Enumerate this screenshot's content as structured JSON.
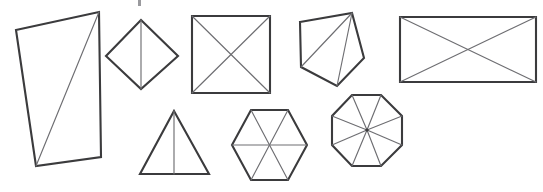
{
  "figure": {
    "background_color": "#ffffff",
    "outline_color": "#3b3b3d",
    "diagonal_color": "#6e6e72",
    "canvas": {
      "width": 543,
      "height": 192
    },
    "shape_count": 8,
    "artifact": {
      "name": "clipped-text-remnant",
      "x": 138,
      "y": 0,
      "width": 3,
      "height": 6
    },
    "shapes": [
      {
        "id": "tilted-rectangle",
        "label": "Tilted rectangle with one diagonal",
        "sides": 4,
        "triangles": 2,
        "outline": "16,30 99,12 101,157 36,166",
        "diagonals": [
          "99,12 36,166"
        ]
      },
      {
        "id": "diamond",
        "label": "Diamond with vertical diagonal",
        "sides": 4,
        "triangles": 2,
        "outline": "141,20 178,56 141,89 106,56",
        "diagonals": [
          "141,20 141,89"
        ]
      },
      {
        "id": "square",
        "label": "Square with both diagonals",
        "sides": 4,
        "triangles": 4,
        "outline": "192,16 270,16 270,93 192,93",
        "diagonals": [
          "192,16 270,93",
          "270,16 192,93"
        ]
      },
      {
        "id": "pentagon",
        "label": "Tilted pentagon fanned from top-right vertex",
        "sides": 5,
        "triangles": 3,
        "outline": "300,22 352,13 364,58 337,86 301,67",
        "diagonals": [
          "352,13 301,67",
          "352,13 337,86"
        ]
      },
      {
        "id": "wide-rectangle",
        "label": "Wide rectangle with both diagonals",
        "sides": 4,
        "triangles": 4,
        "outline": "400,17 536,17 536,82 400,82",
        "diagonals": [
          "400,17 536,82",
          "536,17 400,82"
        ]
      },
      {
        "id": "triangle",
        "label": "Triangle with vertical median",
        "sides": 3,
        "triangles": 2,
        "outline": "174,111 209,174 140,174",
        "diagonals": [
          "174,111 174,174"
        ]
      },
      {
        "id": "hexagon",
        "label": "Hexagon with three main diagonals",
        "sides": 6,
        "triangles": 6,
        "outline": "251,110 288,110 307,145 288,180 251,180 232,145",
        "diagonals": [
          "251,110 288,180",
          "288,110 251,180",
          "232,145 307,145"
        ]
      },
      {
        "id": "octagon",
        "label": "Octagon with eight spokes to center",
        "sides": 8,
        "triangles": 8,
        "outline": "352,95 381,95 402,116 402,145 381,166 352,166 332,145 332,116",
        "center": "367,130",
        "diagonals": [
          "352,95 367,130",
          "381,95 367,130",
          "402,116 367,130",
          "402,145 367,130",
          "381,166 367,130",
          "352,166 367,130",
          "332,145 367,130",
          "332,116 367,130"
        ]
      }
    ]
  }
}
